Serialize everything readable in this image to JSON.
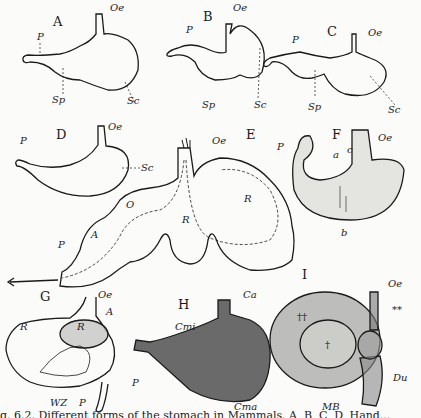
{
  "figure": {
    "panels": [
      {
        "id": "A",
        "letter": "A",
        "labels": {
          "oe": "Oe",
          "p": "P",
          "sp": "Sp",
          "sc": "Sc"
        }
      },
      {
        "id": "B",
        "letter": "B",
        "labels": {
          "oe": "Oe",
          "p": "P",
          "sp": "Sp",
          "sc": "Sc"
        }
      },
      {
        "id": "C",
        "letter": "C",
        "labels": {
          "oe": "Oe",
          "p": "P",
          "sp": "Sp",
          "sc": "Sc"
        }
      },
      {
        "id": "D",
        "letter": "D",
        "labels": {
          "oe": "Oe",
          "p": "P",
          "sc": "Sc"
        }
      },
      {
        "id": "E",
        "letter": "E",
        "labels": {
          "oe": "Oe",
          "p": "P",
          "a": "A",
          "o": "O",
          "r1": "R",
          "r2": "R"
        }
      },
      {
        "id": "F",
        "letter": "F",
        "labels": {
          "oe": "Oe",
          "p": "P",
          "a": "a",
          "c": "c",
          "b": "b"
        }
      },
      {
        "id": "G",
        "letter": "G",
        "labels": {
          "oe": "Oe",
          "a": "A",
          "r1": "R",
          "r2": "R",
          "wz": "WZ",
          "p": "P"
        }
      },
      {
        "id": "H",
        "letter": "H",
        "labels": {
          "ca": "Ca",
          "cmi": "Cmi",
          "cma": "Cma",
          "p": "P"
        }
      },
      {
        "id": "I",
        "letter": "I",
        "labels": {
          "oe": "Oe",
          "stars": "**",
          "dagger2": "††",
          "dagger": "†",
          "du": "Du",
          "mb": "MB"
        }
      }
    ],
    "caption": "g. 6.2.  Different forms of the stomach in Mammals.  A, B, C, D, Hand..."
  }
}
